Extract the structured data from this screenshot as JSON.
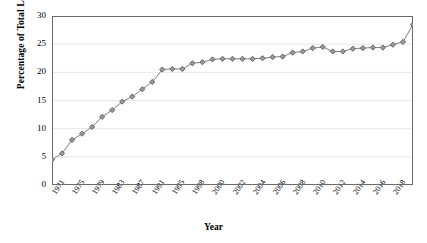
{
  "chart_data": {
    "type": "line",
    "title": "",
    "xlabel": "Year",
    "ylabel": "Percentage of Total Legislators",
    "ylim": [
      0,
      30
    ],
    "yticks": [
      0,
      5,
      10,
      15,
      20,
      25,
      30
    ],
    "xlim": [
      1971,
      2019
    ],
    "grid": "horizontal",
    "legend": "none",
    "marker": "diamond",
    "series_color": "#808080",
    "line_color": "#808080",
    "x": [
      1971,
      1973,
      1975,
      1977,
      1979,
      1981,
      1983,
      1985,
      1987,
      1989,
      1991,
      1993,
      1995,
      1996,
      1997,
      1998,
      1999,
      2000,
      2001,
      2002,
      2003,
      2004,
      2005,
      2006,
      2007,
      2008,
      2009,
      2010,
      2011,
      2012,
      2013,
      2014,
      2015,
      2016,
      2017,
      2018,
      2019
    ],
    "xtick_labels": [
      "1971",
      "",
      "1975",
      "",
      "1979",
      "",
      "1983",
      "",
      "1987",
      "",
      "1991",
      "",
      "1995",
      "",
      "1998",
      "",
      "2000",
      "",
      "2002",
      "",
      "2004",
      "",
      "2006",
      "",
      "2008",
      "",
      "2010",
      "",
      "2012",
      "",
      "2014",
      "",
      "2016",
      "",
      "2018",
      "",
      ""
    ],
    "values": [
      4.5,
      5.6,
      8.0,
      9.1,
      10.3,
      12.1,
      13.3,
      14.8,
      15.7,
      17.0,
      18.3,
      20.5,
      20.6,
      20.6,
      21.6,
      21.8,
      22.3,
      22.4,
      22.4,
      22.4,
      22.4,
      22.5,
      22.7,
      22.8,
      23.5,
      23.7,
      24.3,
      24.5,
      23.7,
      23.7,
      24.2,
      24.3,
      24.4,
      24.4,
      24.9,
      25.4,
      28.5
    ],
    "y_min_value": 4.5,
    "y_max_value": 28.5
  }
}
